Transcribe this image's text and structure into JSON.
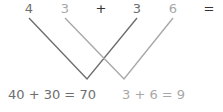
{
  "diagram": {
    "type": "cross-multiplication-lines",
    "top_row": [
      {
        "text": "4",
        "x": 29,
        "tone": "dark"
      },
      {
        "text": "3",
        "x": 65,
        "tone": "light"
      },
      {
        "text": "+",
        "x": 101,
        "tone": "black"
      },
      {
        "text": "3",
        "x": 137,
        "tone": "dark"
      },
      {
        "text": "6",
        "x": 173,
        "tone": "light"
      },
      {
        "text": "=",
        "x": 209,
        "tone": "black"
      }
    ],
    "lines": [
      {
        "name": "tens",
        "color": "#6e6e6e",
        "points": [
          [
            29,
            18
          ],
          [
            87,
            79
          ],
          [
            137,
            18
          ]
        ]
      },
      {
        "name": "ones",
        "color": "#a8a8a8",
        "points": [
          [
            65,
            18
          ],
          [
            124,
            79
          ],
          [
            173,
            18
          ]
        ]
      }
    ],
    "results": {
      "tens": "40 + 30 = 70",
      "ones": "3 + 6 = 9"
    },
    "colors": {
      "dark": "#6e6e6e",
      "light": "#a8a8a8",
      "black": "#333333"
    }
  }
}
